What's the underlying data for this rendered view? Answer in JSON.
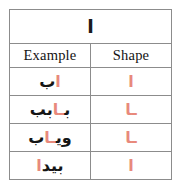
{
  "figure": {
    "letter": "ا",
    "letter_name": "alif",
    "highlight_color": "#e8897c",
    "text_color": "#151515",
    "border_color": "#8c8c8c",
    "background": "#ffffff"
  },
  "table": {
    "headers": {
      "example": "Example",
      "shape": "Shape"
    },
    "rows": [
      {
        "example_before": "",
        "example_letter": "ا",
        "example_after": "ب",
        "shape": "ا"
      },
      {
        "example_before": "ب",
        "example_letter": "ـا",
        "example_after": "بب",
        "shape": "ـا"
      },
      {
        "example_before": "وي",
        "example_letter": "ـا",
        "example_after": "ب",
        "shape": "ـا"
      },
      {
        "example_before": "بيد",
        "example_letter": "ا",
        "example_after": "",
        "shape": "ا"
      }
    ]
  }
}
